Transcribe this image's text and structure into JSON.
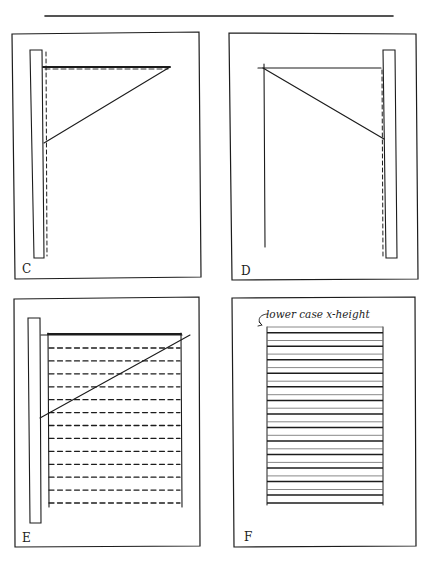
{
  "figure": {
    "type": "layout-construction-diagram",
    "panels": [
      {
        "id": "C",
        "label": "C",
        "description": "Ruler placed at left margin; horizontal top line with dashed guide and diagonal down to ruler",
        "ruler_side": "left",
        "has_diagonal": true,
        "dashed_guides": 2
      },
      {
        "id": "D",
        "label": "D",
        "description": "Ruler placed at right margin; horizontal top line and diagonal down to ruler with dashed vertical guide",
        "ruler_side": "right",
        "has_diagonal": true,
        "dashed_guides": 1
      },
      {
        "id": "E",
        "label": "E",
        "description": "Ruler at left; text block with dashed horizontal ruling lines and diagonal",
        "ruler_side": "left",
        "has_diagonal": true,
        "dashed_rows": 13
      },
      {
        "id": "F",
        "label": "F",
        "description": "Finished ruled block with paired lines marking lower case x-height",
        "annotation": "lower case x-height",
        "line_pairs": 13
      }
    ]
  }
}
